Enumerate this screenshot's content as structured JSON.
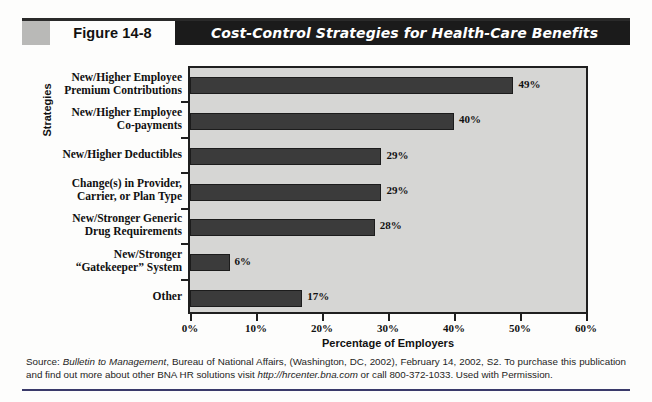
{
  "header": {
    "figure_number": "Figure 14-8",
    "title": "Cost-Control Strategies for Health-Care Benefits"
  },
  "chart_data": {
    "type": "bar",
    "orientation": "horizontal",
    "title": "Cost-Control Strategies for Health-Care Benefits",
    "xlabel": "Percentage of Employers",
    "ylabel": "Strategies",
    "xlim": [
      0,
      60
    ],
    "xticks": [
      0,
      10,
      20,
      30,
      40,
      50,
      60
    ],
    "xtick_labels": [
      "0%",
      "10%",
      "20%",
      "30%",
      "40%",
      "50%",
      "60%"
    ],
    "grid": false,
    "legend": null,
    "bar_color": "#3b3b3b",
    "plot_background": "#d6d6d4",
    "categories": [
      "New/Higher Employee\nPremium Contributions",
      "New/Higher Employee\nCo-payments",
      "New/Higher Deductibles",
      "Change(s) in Provider,\nCarrier, or Plan Type",
      "New/Stronger Generic\nDrug Requirements",
      "New/Stronger\n“Gatekeeper” System",
      "Other"
    ],
    "values": [
      49,
      40,
      29,
      29,
      28,
      6,
      17
    ],
    "value_labels": [
      "49%",
      "40%",
      "29%",
      "29%",
      "28%",
      "6%",
      "17%"
    ]
  },
  "source": {
    "line": "Source: Bulletin to Management, Bureau of National Affairs, (Washington, DC, 2002), February 14, 2002, S2. To purchase this publication and find out more about other BNA HR solutions visit http://hrcenter.bna.com or call 800-372-1033. Used with Permission.",
    "prefix": "Source: ",
    "italic_title": "Bulletin to Management",
    "mid": ", Bureau of National Affairs, (Washington, DC, 2002), February 14, 2002, S2. To purchase this publication and find out more about other BNA HR solutions visit ",
    "italic_url": "http://hrcenter.bna.com",
    "suffix": " or call 800-372-1033. Used with Permission."
  }
}
